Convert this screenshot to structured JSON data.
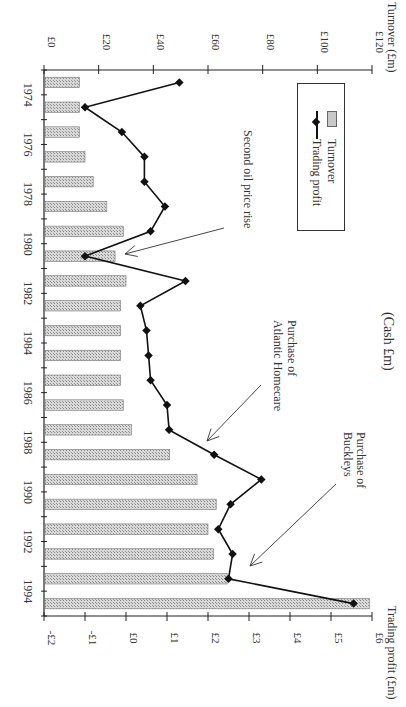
{
  "chart_data": {
    "type": "bar",
    "orientation": "rotated-90-clockwise",
    "title": "",
    "center_label": "(Cash £m)",
    "categories": [
      "1974",
      "1975",
      "1976",
      "1977",
      "1978",
      "1979",
      "1980",
      "1981",
      "1982",
      "1983",
      "1984",
      "1985",
      "1986",
      "1987",
      "1988",
      "1989",
      "1990",
      "1991",
      "1992",
      "1993",
      "1994",
      "1995"
    ],
    "year_tick_labels": [
      "1974",
      "1976",
      "1978",
      "1980",
      "1982",
      "1984",
      "1986",
      "1988",
      "1990",
      "1992",
      "1994"
    ],
    "series": [
      {
        "name": "Turnover",
        "type": "bar",
        "axis": "Turnover (£m)",
        "values": [
          13,
          13,
          13,
          15,
          18,
          23,
          29,
          26,
          30,
          28,
          28,
          28,
          28,
          29,
          32,
          46,
          56,
          63,
          60,
          62,
          67,
          119
        ]
      },
      {
        "name": "Trading profit",
        "type": "line",
        "axis": "Trading profit (£m)",
        "values": [
          1.3,
          -1.0,
          -0.1,
          0.45,
          0.45,
          0.95,
          0.6,
          -1.0,
          1.45,
          0.35,
          0.5,
          0.55,
          0.6,
          1.0,
          1.05,
          2.15,
          3.3,
          2.55,
          2.25,
          2.6,
          2.5,
          5.55
        ]
      }
    ],
    "axes": {
      "turnover": {
        "label": "Turnover (£m)",
        "ticks": [
          "£0",
          "£20",
          "£40",
          "£60",
          "£80",
          "£100",
          "£120"
        ],
        "range": [
          0,
          120
        ]
      },
      "profit": {
        "label": "Trading profit (£m)",
        "ticks": [
          "-£2",
          "-£1",
          "£0",
          "£1",
          "£2",
          "£3",
          "£4",
          "£5",
          "£6"
        ],
        "range": [
          -2,
          6
        ]
      }
    },
    "legend": {
      "items": [
        "Turnover",
        "Trading profit"
      ],
      "position": "top-right (rotated)"
    },
    "annotations": [
      {
        "text": "Second oil price rise",
        "year": "1981"
      },
      {
        "text_lines": [
          "Purchase of",
          "Atlantic Homecare"
        ],
        "year": "1988"
      },
      {
        "text_lines": [
          "Purchase of",
          "Buckleys"
        ],
        "year": "1994"
      }
    ],
    "grid": false
  }
}
